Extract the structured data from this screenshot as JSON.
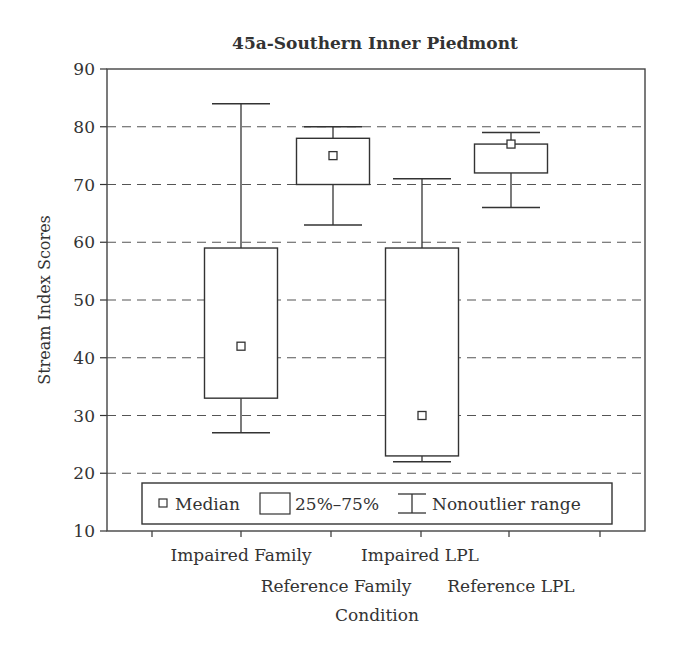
{
  "chart_data": {
    "type": "boxplot",
    "title": "45a-Southern Inner Piedmont",
    "xlabel": "Condition",
    "ylabel": "Stream Index Scores",
    "ylim": [
      10,
      90
    ],
    "yticks": [
      10,
      20,
      30,
      40,
      50,
      60,
      70,
      80,
      90
    ],
    "grid": {
      "horizontal": true,
      "style": "dashed"
    },
    "legend": {
      "position": "bottom-inside",
      "entries": [
        {
          "symbol": "small-square",
          "label": "Median"
        },
        {
          "symbol": "box",
          "label": "25%–75%"
        },
        {
          "symbol": "whisker",
          "label": "Nonoutlier range"
        }
      ]
    },
    "categories": [
      "Impaired Family",
      "Reference Family",
      "Impaired LPL",
      "Reference LPL"
    ],
    "series": [
      {
        "name": "Impaired Family",
        "min": 27,
        "q1": 33,
        "median": 42,
        "q3": 59,
        "max": 84
      },
      {
        "name": "Reference Family",
        "min": 63,
        "q1": 70,
        "median": 75,
        "q3": 78,
        "max": 80
      },
      {
        "name": "Impaired LPL",
        "min": 22,
        "q1": 23,
        "median": 30,
        "q3": 59,
        "max": 71
      },
      {
        "name": "Reference LPL",
        "min": 66,
        "q1": 72,
        "median": 77,
        "q3": 77,
        "max": 79
      }
    ]
  },
  "colors": {
    "ink": "#333333",
    "grid": "#555555",
    "background": "#ffffff"
  }
}
